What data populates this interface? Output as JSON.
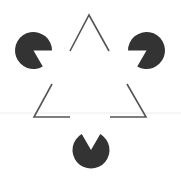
{
  "figure": {
    "width": 181,
    "height": 179,
    "background": "#ffffff"
  },
  "colors": {
    "inducer_fill": "#333333",
    "outline_stroke": "#555555",
    "faint_line": "#ededed"
  },
  "inducers": [
    {
      "name": "top-left",
      "cx": 33.5,
      "cy": 50.5,
      "r": 18.5,
      "mouth_start_deg": 0,
      "mouth_end_deg": 60
    },
    {
      "name": "top-right",
      "cx": 146.5,
      "cy": 50.5,
      "r": 18.5,
      "mouth_start_deg": 120,
      "mouth_end_deg": 180
    },
    {
      "name": "bottom",
      "cx": 91,
      "cy": 150,
      "r": 18.5,
      "mouth_start_deg": 240,
      "mouth_end_deg": 300
    }
  ],
  "outline_segments": [
    {
      "name": "apex",
      "points": [
        [
          70,
          51
        ],
        [
          89,
          15
        ],
        [
          109,
          51
        ]
      ]
    },
    {
      "name": "bottom-left-corner",
      "points": [
        [
          52,
          84
        ],
        [
          34,
          117
        ],
        [
          70,
          117
        ]
      ]
    },
    {
      "name": "bottom-right-corner",
      "points": [
        [
          127,
          84
        ],
        [
          146,
          117
        ],
        [
          110,
          117
        ]
      ]
    }
  ],
  "faint_line": {
    "y": 113,
    "x1": 0,
    "x2": 181
  }
}
